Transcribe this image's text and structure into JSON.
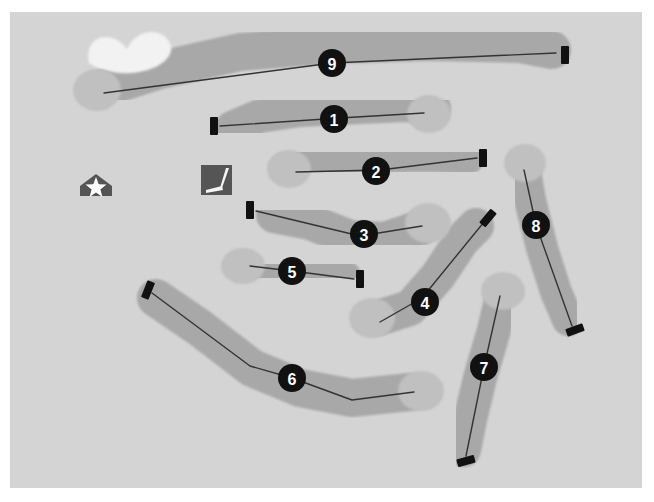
{
  "map": {
    "title": "Golf Course Layout Map",
    "background_color": "#ffffff",
    "field_color": "#d4d4d4",
    "fairway_color": "#a8a8a8",
    "green_color": "#c0c0c0",
    "bunker_color": "#f2f2f2",
    "tee_marker_color": "#111111",
    "badge_color": "#111111",
    "badge_text_color": "#ffffff",
    "play_line_color": "#333333",
    "field": {
      "x": 10,
      "y": 12,
      "width": 632,
      "height": 476
    }
  },
  "markers": [
    {
      "name": "clubhouse",
      "label": "clubhouse-marker",
      "icon": "house-star-icon",
      "x": 96,
      "y": 190,
      "color": "#555555",
      "star_color": "#ffffff"
    },
    {
      "name": "practice-green",
      "label": "practice-green-marker",
      "icon": "golf-club-icon",
      "x": 217,
      "y": 180,
      "color": "#555555",
      "club_color": "#f5f5f5"
    }
  ],
  "bunkers": [
    {
      "name": "bunker-hole-9",
      "cx": 130,
      "cy": 55,
      "rx": 42,
      "ry": 20,
      "rotation": -8
    }
  ],
  "holes": [
    {
      "number": "1",
      "badge": {
        "x": 334,
        "y": 119
      },
      "tee": {
        "x": 214,
        "y": 126,
        "angle": 0
      },
      "green": {
        "cx": 429,
        "cy": 114,
        "rx": 22,
        "ry": 19
      },
      "fairway_points": "232,128 260,116 300,110 360,107 406,105 434,108",
      "fairway_width": 34,
      "play_line": "220,126 340,118 424,113"
    },
    {
      "number": "2",
      "badge": {
        "x": 376,
        "y": 171
      },
      "tee": {
        "x": 483,
        "y": 158,
        "angle": 0
      },
      "green": {
        "cx": 289,
        "cy": 169,
        "rx": 22,
        "ry": 19
      },
      "fairway_points": "286,169 330,160 380,156 430,155 468,157",
      "fairway_width": 34,
      "play_line": "296,172 380,170 477,158"
    },
    {
      "number": "3",
      "badge": {
        "x": 364,
        "y": 234
      },
      "tee": {
        "x": 250,
        "y": 210,
        "angle": 0
      },
      "green": {
        "cx": 428,
        "cy": 223,
        "rx": 23,
        "ry": 20
      },
      "fairway_points": "274,215 310,222 350,238 384,240 420,228",
      "fairway_width": 36,
      "play_line": "256,211 360,236 422,226",
      "dogleg": true
    },
    {
      "number": "4",
      "badge": {
        "x": 425,
        "y": 302
      },
      "tee": {
        "x": 488,
        "y": 218,
        "angle": 40
      },
      "green": {
        "cx": 372,
        "cy": 318,
        "rx": 23,
        "ry": 20
      },
      "fairway_points": "378,318 410,308 438,276 462,240 476,226",
      "fairway_width": 36,
      "play_line": "484,222 422,298 380,322",
      "dogleg": true
    },
    {
      "number": "5",
      "badge": {
        "x": 292,
        "y": 271
      },
      "tee": {
        "x": 360,
        "y": 279,
        "angle": 0
      },
      "green": {
        "cx": 243,
        "cy": 266,
        "rx": 22,
        "ry": 18
      },
      "fairway_points": "242,266 280,268 315,272 346,276",
      "fairway_width": 30,
      "play_line": "250,266 292,271 354,279"
    },
    {
      "number": "6",
      "badge": {
        "x": 292,
        "y": 378
      },
      "tee": {
        "x": 148,
        "y": 290,
        "angle": 22
      },
      "green": {
        "cx": 421,
        "cy": 391,
        "rx": 23,
        "ry": 20
      },
      "fairway_points": "156,298 200,328 252,368 300,388 352,398 410,392",
      "fairway_width": 38,
      "play_line": "152,293 250,366 292,378 352,400 414,392",
      "dogleg": true
    },
    {
      "number": "7",
      "badge": {
        "x": 484,
        "y": 367
      },
      "tee": {
        "x": 466,
        "y": 461,
        "angle": 75
      },
      "green": {
        "cx": 503,
        "cy": 291,
        "rx": 22,
        "ry": 19
      },
      "fairway_points": "503,292 494,330 480,378 470,420 464,450",
      "fairway_width": 34,
      "play_line": "500,296 484,367 466,456"
    },
    {
      "number": "8",
      "badge": {
        "x": 536,
        "y": 225
      },
      "tee": {
        "x": 575,
        "y": 330,
        "angle": 70
      },
      "green": {
        "cx": 525,
        "cy": 163,
        "rx": 21,
        "ry": 19
      },
      "fairway_points": "524,164 530,200 542,248 556,292 568,320",
      "fairway_width": 32,
      "play_line": "524,170 536,225 572,326"
    },
    {
      "number": "9",
      "badge": {
        "x": 332,
        "y": 63
      },
      "tee": {
        "x": 565,
        "y": 55,
        "angle": 0
      },
      "green": {
        "cx": 97,
        "cy": 90,
        "rx": 24,
        "ry": 21
      },
      "fairway_points": "98,90 160,70 240,52 330,45 430,42 520,44 552,50",
      "fairway_width": 38,
      "play_line": "104,93 332,63 556,53"
    }
  ]
}
